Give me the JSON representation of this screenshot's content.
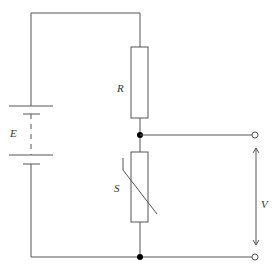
{
  "diagram": {
    "type": "circuit-schematic",
    "components": {
      "battery": {
        "label": "E",
        "kind": "battery-two-cell"
      },
      "resistor": {
        "label": "R",
        "kind": "fixed-resistor"
      },
      "sensor": {
        "label": "S",
        "kind": "variable-resistor-nonlinear"
      },
      "output": {
        "label": "V",
        "kind": "output-voltage"
      }
    },
    "colors": {
      "wire": "#555555",
      "node": "#000000",
      "background": "#ffffff"
    }
  }
}
